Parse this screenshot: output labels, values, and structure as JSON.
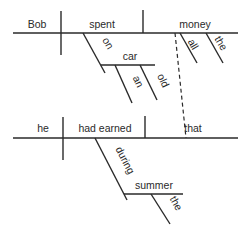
{
  "diagram": {
    "type": "sentence-diagram",
    "sentence": "Bob spent all the money that he had earned during the summer on an old car.",
    "main_clause": {
      "subject": "Bob",
      "verb": "spent",
      "object": "money",
      "object_modifiers": [
        "all",
        "the"
      ],
      "prep_phrase": {
        "preposition": "on",
        "object": "car",
        "modifiers": [
          "an",
          "old"
        ]
      }
    },
    "relative_clause": {
      "subject": "he",
      "verb": "had earned",
      "object": "that",
      "prep_phrase": {
        "preposition": "during",
        "object": "summer",
        "modifiers": [
          "the"
        ]
      }
    },
    "connector": "dashed line from money to that"
  }
}
